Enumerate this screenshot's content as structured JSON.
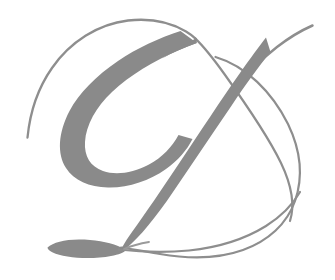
{
  "artwork": {
    "kind": "ornamental-initial",
    "letter": "D",
    "script_style": "copperplate-calligraphic-swash",
    "alt_text": "Decorative calligraphic capital letter D in gray",
    "caption": "D"
  },
  "canvas": {
    "width": 335,
    "height": 280,
    "background_color": "#ffffff"
  },
  "palette": {
    "background": "#ffffff",
    "stroke_gray": "#8a8a8a",
    "stroke_gray_light": "#9a9a9a",
    "stroke_gray_dark": "#7e7e7e",
    "hairline_gray": "#8e8e8e"
  },
  "strokes": [
    {
      "name": "outer-swash-loop",
      "role": "hairline",
      "description": "Large thin elliptical flourish looping over the top and around the right side",
      "width_px": 2.1
    },
    {
      "name": "bowl-thick-stroke",
      "role": "thick",
      "description": "Swelling bowl of the D, thin at top crossing, widest at left, closing at bottom",
      "max_width_px": 30
    },
    {
      "name": "diagonal-stem",
      "role": "thick",
      "description": "Thick descending diagonal from upper right to lower left tail junction",
      "max_width_px": 26
    },
    {
      "name": "upper-right-flourish",
      "role": "hairline",
      "description": "Thin entry stroke rising to the upper right terminus",
      "width_px": 2.4
    },
    {
      "name": "bottom-left-tail",
      "role": "thick",
      "description": "Tapered leaf shaped terminal tail at lower left",
      "max_width_px": 13
    },
    {
      "name": "bottom-sweep",
      "role": "hairline",
      "description": "Thin sweeping baseline curve running to the lower right",
      "width_px": 2.2
    }
  ]
}
